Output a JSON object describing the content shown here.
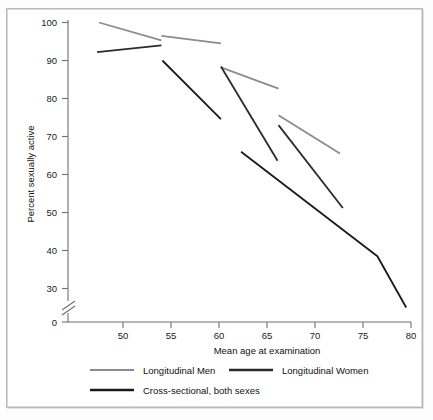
{
  "figure": {
    "background": "#ffffff",
    "frame_color": "#b9b9b9"
  },
  "axes": {
    "y_title": "Percent sexually active",
    "x_title": "Mean age at examination",
    "y_ticks": [
      "100",
      "90",
      "80",
      "70",
      "60",
      "50",
      "40",
      "30",
      "0"
    ],
    "x_ticks": [
      "50",
      "55",
      "60",
      "65",
      "70",
      "75",
      "80"
    ],
    "y_axis_break": true
  },
  "legend": {
    "position": "below-axes",
    "entries": [
      {
        "label": "Longitudinal Men",
        "color": "#8c8c8c"
      },
      {
        "label": "Longitudinal Women",
        "color": "#2b2b2b"
      },
      {
        "label": "Cross-sectional, both sexes",
        "color": "#1a1a1a"
      }
    ]
  },
  "chart_data": {
    "type": "line",
    "title": "",
    "xlabel": "Mean age at examination",
    "ylabel": "Percent sexually active",
    "xlim": [
      46,
      80.5
    ],
    "ylim": [
      30,
      101
    ],
    "y_axis_break_below": 30,
    "y_zero_shown": true,
    "grid": false,
    "legend_position": "bottom",
    "series": [
      {
        "name": "Longitudinal Men",
        "color": "#8c8c8c",
        "linewidth": 1.8,
        "segments": [
          {
            "x": [
              47.5,
              54.0
            ],
            "y": [
              100.0,
              95.3
            ]
          },
          {
            "x": [
              54.0,
              60.2
            ],
            "y": [
              96.5,
              94.5
            ]
          },
          {
            "x": [
              60.2,
              66.2
            ],
            "y": [
              88.2,
              82.6
            ]
          },
          {
            "x": [
              66.2,
              72.6
            ],
            "y": [
              75.6,
              65.5
            ]
          }
        ]
      },
      {
        "name": "Longitudinal Women",
        "color": "#2b2b2b",
        "linewidth": 1.8,
        "segments": [
          {
            "x": [
              47.3,
              54.0
            ],
            "y": [
              92.2,
              94.0
            ]
          },
          {
            "x": [
              60.2,
              66.1
            ],
            "y": [
              88.4,
              63.6
            ]
          },
          {
            "x": [
              66.2,
              72.9
            ],
            "y": [
              73.0,
              51.2
            ]
          }
        ]
      },
      {
        "name": "Cross-sectional, both sexes",
        "color": "#1a1a1a",
        "linewidth": 1.8,
        "segments": [
          {
            "x": [
              54.1,
              60.2
            ],
            "y": [
              90.0,
              74.6
            ]
          },
          {
            "x": [
              62.3,
              76.5,
              79.5
            ],
            "y": [
              66.0,
              38.5,
              25.0
            ]
          }
        ]
      }
    ]
  }
}
